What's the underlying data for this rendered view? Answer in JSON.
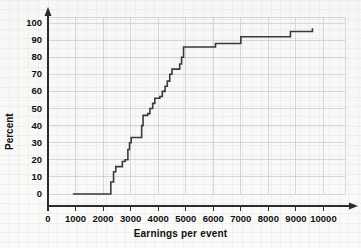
{
  "chart_data": {
    "type": "line",
    "subtype": "step-cumulative-ogive",
    "title": "",
    "xlabel": "Earnings per event",
    "ylabel": "Percent",
    "xlim": [
      0,
      10600
    ],
    "ylim": [
      -3,
      103
    ],
    "xticks": [
      0,
      1000,
      2000,
      3000,
      4000,
      5000,
      6000,
      7000,
      8000,
      9000,
      10000
    ],
    "xtick_labels": [
      "0",
      "1000",
      "2000",
      "3000",
      "4000",
      "5000",
      "6000",
      "7000",
      "8000",
      "9000",
      "10000"
    ],
    "yticks": [
      0,
      10,
      20,
      30,
      40,
      50,
      60,
      70,
      80,
      90,
      100
    ],
    "ytick_labels": [
      "0",
      "10",
      "20",
      "30",
      "40",
      "50",
      "60",
      "70",
      "80",
      "90",
      "100"
    ],
    "grid": true,
    "grid_color": "#c9c9c9",
    "minor_grid": true,
    "minor_grid_color": "#e6e6e4",
    "legend": false,
    "legend_position": "none",
    "line_color": "#3a3a3a",
    "line_width": 1.6,
    "axis_arrows": true,
    "series": [
      {
        "name": "Cumulative percent",
        "x": [
          900,
          2250,
          2300,
          2400,
          2500,
          2600,
          2700,
          2800,
          2900,
          2950,
          3050,
          3150,
          3250,
          3350,
          3400,
          3500,
          3600,
          3700,
          3800,
          3900,
          4000,
          4100,
          4200,
          4300,
          4400,
          4500,
          4600,
          4700,
          4800,
          4900,
          5000,
          6000,
          6050,
          6900,
          7000,
          8700,
          8800,
          9550,
          9600
        ],
        "y": [
          0,
          0,
          7,
          13,
          16,
          16,
          19,
          20,
          26,
          30,
          33,
          33,
          33,
          40,
          46,
          47,
          47,
          50,
          53,
          56,
          57,
          60,
          63,
          66,
          70,
          73,
          73,
          75,
          79,
          82,
          86,
          86,
          88,
          88,
          92,
          92,
          95,
          95,
          97
        ]
      }
    ],
    "step_points": [
      {
        "x": 900,
        "y": 0
      },
      {
        "x": 2250,
        "y": 0
      },
      {
        "x": 2280,
        "y": 7
      },
      {
        "x": 2380,
        "y": 13
      },
      {
        "x": 2460,
        "y": 16
      },
      {
        "x": 2640,
        "y": 16
      },
      {
        "x": 2700,
        "y": 19
      },
      {
        "x": 2800,
        "y": 20
      },
      {
        "x": 2900,
        "y": 26
      },
      {
        "x": 2960,
        "y": 30
      },
      {
        "x": 3020,
        "y": 33
      },
      {
        "x": 3330,
        "y": 33
      },
      {
        "x": 3400,
        "y": 40
      },
      {
        "x": 3450,
        "y": 46
      },
      {
        "x": 3620,
        "y": 47
      },
      {
        "x": 3700,
        "y": 50
      },
      {
        "x": 3800,
        "y": 53
      },
      {
        "x": 3880,
        "y": 56
      },
      {
        "x": 4060,
        "y": 57
      },
      {
        "x": 4150,
        "y": 60
      },
      {
        "x": 4250,
        "y": 63
      },
      {
        "x": 4330,
        "y": 66
      },
      {
        "x": 4420,
        "y": 70
      },
      {
        "x": 4500,
        "y": 73
      },
      {
        "x": 4720,
        "y": 73
      },
      {
        "x": 4780,
        "y": 76
      },
      {
        "x": 4850,
        "y": 80
      },
      {
        "x": 4920,
        "y": 86
      },
      {
        "x": 6000,
        "y": 86
      },
      {
        "x": 6080,
        "y": 88
      },
      {
        "x": 6920,
        "y": 88
      },
      {
        "x": 7000,
        "y": 92
      },
      {
        "x": 8720,
        "y": 92
      },
      {
        "x": 8800,
        "y": 95
      },
      {
        "x": 9560,
        "y": 95
      },
      {
        "x": 9600,
        "y": 97
      }
    ]
  },
  "axes": {
    "y_title": "Percent",
    "x_title": "Earnings per event"
  }
}
